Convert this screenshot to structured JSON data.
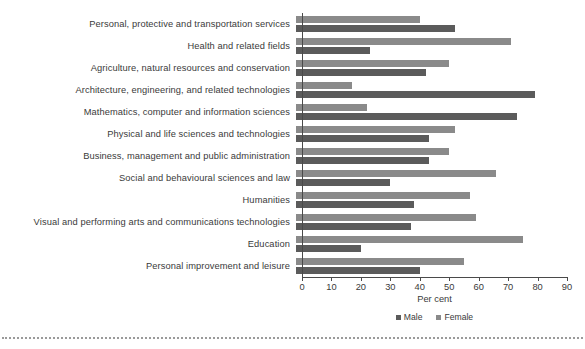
{
  "chart_data": {
    "type": "bar",
    "orientation": "horizontal",
    "title": "",
    "xlabel": "Per cent",
    "ylabel": "",
    "xlim": [
      0,
      90
    ],
    "xticks": [
      0,
      10,
      20,
      30,
      40,
      50,
      60,
      70,
      80,
      90
    ],
    "grid": false,
    "legend_position": "bottom",
    "categories": [
      "Personal, protective and transportation services",
      "Health and related fields",
      "Agriculture, natural resources and conservation",
      "Architecture, engineering, and related technologies",
      "Mathematics, computer and information sciences",
      "Physical and life sciences and technologies",
      "Business, management and public administration",
      "Social and behavioural sciences and law",
      "Humanities",
      "Visual and performing arts and communications technologies",
      "Education",
      "Personal improvement and leisure"
    ],
    "series": [
      {
        "name": "Female",
        "color": "#8a8a8a",
        "values": [
          42,
          73,
          52,
          19,
          24,
          54,
          52,
          68,
          59,
          61,
          77,
          57
        ]
      },
      {
        "name": "Male",
        "color": "#5b5b5b",
        "values": [
          54,
          25,
          44,
          81,
          75,
          45,
          45,
          32,
          40,
          39,
          22,
          42
        ]
      }
    ]
  },
  "legend": {
    "items": [
      {
        "label": "Male",
        "swatch": "male-swatch"
      },
      {
        "label": "Female",
        "swatch": "female-swatch"
      }
    ]
  },
  "axis": {
    "x_title": "Per cent",
    "tick_labels": [
      "0",
      "10",
      "20",
      "30",
      "40",
      "50",
      "60",
      "70",
      "80",
      "90"
    ]
  },
  "colors": {
    "male": "#5b5b5b",
    "female": "#8a8a8a",
    "axis": "#4a4a4a",
    "text": "#3a3a3a",
    "background": "#ffffff",
    "divider": "#9a9a9a"
  }
}
